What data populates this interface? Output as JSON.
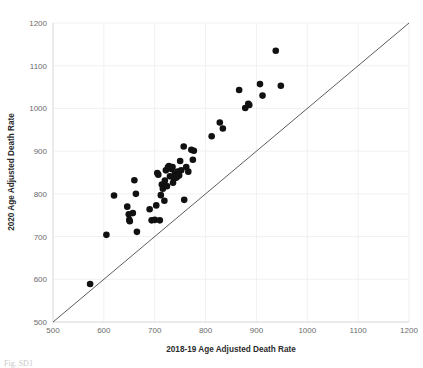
{
  "figure": {
    "caption_fragment": "Fig. SD1",
    "background_color": "#ffffff"
  },
  "chart_data": {
    "type": "scatter",
    "title": "",
    "xlabel": "2018-19 Age Adjusted Death Rate",
    "ylabel": "2020 Age Adjusted Death Rate",
    "xlim": [
      500,
      1200
    ],
    "ylim": [
      500,
      1200
    ],
    "xticks": [
      500,
      600,
      700,
      800,
      900,
      1000,
      1100,
      1200
    ],
    "yticks": [
      500,
      600,
      700,
      800,
      900,
      1000,
      1100,
      1200
    ],
    "xtick_labels": [
      "500",
      "600",
      "700",
      "800",
      "900",
      "1000",
      "1100",
      "1200"
    ],
    "ytick_labels": [
      "500",
      "600",
      "700",
      "800",
      "900",
      "1000",
      "1100",
      "1200"
    ],
    "grid": true,
    "legend": false,
    "marker_color": "#111111",
    "marker_size": 3.3,
    "reference_line": {
      "name": "identity-line",
      "from": [
        500,
        500
      ],
      "to": [
        1200,
        1200
      ],
      "color": "#4b4b4b",
      "label": "y = x"
    },
    "points": [
      [
        573,
        589
      ],
      [
        605,
        704
      ],
      [
        620,
        796
      ],
      [
        646,
        770
      ],
      [
        649,
        752
      ],
      [
        650,
        739
      ],
      [
        651,
        736
      ],
      [
        657,
        755
      ],
      [
        660,
        832
      ],
      [
        663,
        800
      ],
      [
        665,
        711
      ],
      [
        690,
        764
      ],
      [
        694,
        738
      ],
      [
        700,
        739
      ],
      [
        703,
        773
      ],
      [
        705,
        849
      ],
      [
        707,
        845
      ],
      [
        710,
        738
      ],
      [
        712,
        797
      ],
      [
        714,
        822
      ],
      [
        716,
        812
      ],
      [
        719,
        784
      ],
      [
        720,
        831
      ],
      [
        722,
        855
      ],
      [
        724,
        818
      ],
      [
        726,
        862
      ],
      [
        728,
        865
      ],
      [
        730,
        841
      ],
      [
        733,
        858
      ],
      [
        735,
        863
      ],
      [
        736,
        826
      ],
      [
        738,
        836
      ],
      [
        740,
        847
      ],
      [
        742,
        838
      ],
      [
        744,
        840
      ],
      [
        745,
        852
      ],
      [
        748,
        843
      ],
      [
        750,
        877
      ],
      [
        752,
        855
      ],
      [
        757,
        911
      ],
      [
        758,
        786
      ],
      [
        762,
        863
      ],
      [
        766,
        852
      ],
      [
        772,
        903
      ],
      [
        775,
        880
      ],
      [
        777,
        901
      ],
      [
        812,
        935
      ],
      [
        828,
        967
      ],
      [
        834,
        953
      ],
      [
        866,
        1043
      ],
      [
        878,
        1001
      ],
      [
        884,
        1011
      ],
      [
        886,
        1008
      ],
      [
        907,
        1057
      ],
      [
        912,
        1030
      ],
      [
        938,
        1135
      ],
      [
        948,
        1053
      ]
    ],
    "n_points": 57
  }
}
